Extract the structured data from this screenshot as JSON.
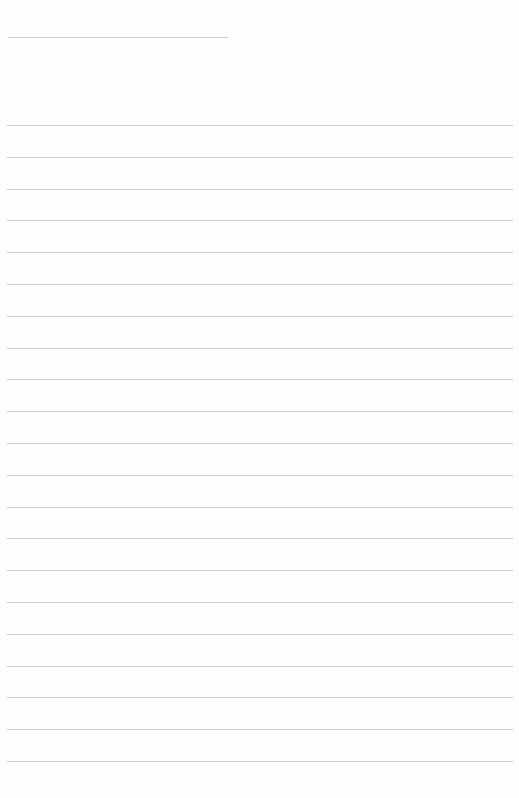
{
  "document": {
    "type": "lined-paper",
    "header_line": {
      "present": true,
      "width_px": 220
    },
    "ruled_lines": {
      "count": 21,
      "first_y": 125,
      "spacing_px": 31.8
    },
    "line_color": "#cccccc",
    "background_color": "#fefefe",
    "text": []
  }
}
